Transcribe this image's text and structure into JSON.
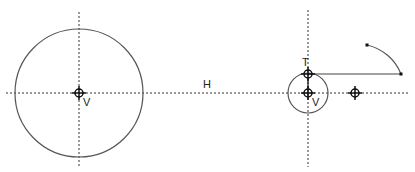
{
  "canvas": {
    "width": 415,
    "height": 172,
    "background": "#ffffff"
  },
  "colors": {
    "stroke": "#555555",
    "construction": "#333333",
    "point": "#111111"
  },
  "labels": {
    "left_center": "V",
    "right_center": "V",
    "top_point": "T",
    "horizontal_axis": "H"
  },
  "geometry": {
    "horizontal_axis": {
      "y": 93,
      "x1": 6,
      "x2": 410
    },
    "left_vertical_axis": {
      "x": 79,
      "y1": 12,
      "y2": 167
    },
    "right_vertical_axis": {
      "x": 308,
      "y1": 10,
      "y2": 167
    },
    "large_circle": {
      "cx": 79,
      "cy": 93,
      "r": 64
    },
    "small_circle": {
      "cx": 308,
      "cy": 93,
      "r": 20
    },
    "line_segment": {
      "x1": 308,
      "y1": 74,
      "x2": 401,
      "y2": 74
    },
    "arc": {
      "x1": 401,
      "y1": 74,
      "x2": 367,
      "y2": 45
    },
    "extra_marker": {
      "x": 355,
      "y": 93
    }
  }
}
